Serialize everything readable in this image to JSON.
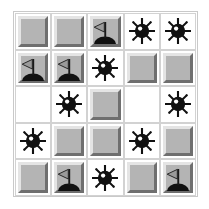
{
  "app": {
    "title": "Minesweeper Board",
    "grid_rows": 5,
    "grid_cols": 5
  },
  "legend": {
    "covered_label": "covered",
    "empty_label": "empty",
    "mine_label": "mine",
    "flag_label": "flag"
  },
  "colors": {
    "background": "#ffffff",
    "tile_face": "#b4b4b4",
    "tile_highlight": "#e4e4e4",
    "tile_shadow": "#6f6f6f",
    "cell_border": "#d2d2d2",
    "frame_border": "#c9c9c9",
    "mine_body": "#111111",
    "mine_highlight": "#ffffff",
    "flag_pennant": "#9a9a9a",
    "flag_pole": "#1a1a1a",
    "flag_mound": "#111111"
  },
  "board": {
    "cells": [
      [
        {
          "state": "covered",
          "icon": ""
        },
        {
          "state": "covered",
          "icon": ""
        },
        {
          "state": "flag",
          "icon": "flag-icon"
        },
        {
          "state": "mine",
          "icon": "mine-icon"
        },
        {
          "state": "mine",
          "icon": "mine-icon"
        }
      ],
      [
        {
          "state": "flag",
          "icon": "flag-icon"
        },
        {
          "state": "flag",
          "icon": "flag-icon"
        },
        {
          "state": "mine",
          "icon": "mine-icon"
        },
        {
          "state": "covered",
          "icon": ""
        },
        {
          "state": "covered",
          "icon": ""
        }
      ],
      [
        {
          "state": "empty",
          "icon": ""
        },
        {
          "state": "mine",
          "icon": "mine-icon"
        },
        {
          "state": "covered",
          "icon": ""
        },
        {
          "state": "empty",
          "icon": ""
        },
        {
          "state": "mine",
          "icon": "mine-icon"
        }
      ],
      [
        {
          "state": "mine",
          "icon": "mine-icon"
        },
        {
          "state": "covered",
          "icon": ""
        },
        {
          "state": "covered",
          "icon": ""
        },
        {
          "state": "mine",
          "icon": "mine-icon"
        },
        {
          "state": "covered",
          "icon": ""
        }
      ],
      [
        {
          "state": "covered",
          "icon": ""
        },
        {
          "state": "flag",
          "icon": "flag-icon"
        },
        {
          "state": "mine",
          "icon": "mine-icon"
        },
        {
          "state": "covered",
          "icon": ""
        },
        {
          "state": "flag",
          "icon": "flag-icon"
        }
      ]
    ],
    "counts": {
      "mines": 9,
      "flags": 5,
      "covered": 9,
      "empty": 2
    }
  }
}
